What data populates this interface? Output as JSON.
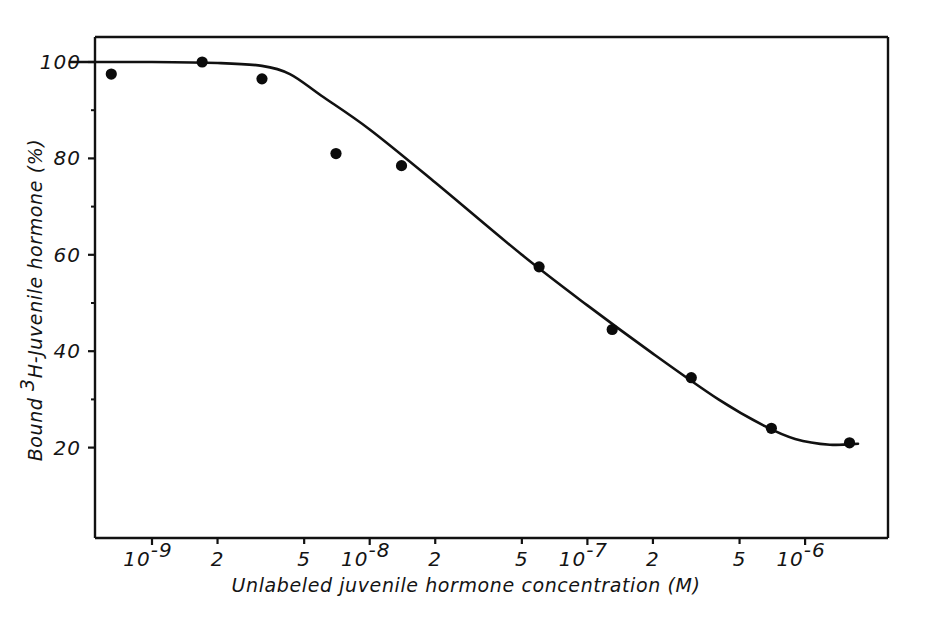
{
  "chart_data": {
    "type": "line",
    "title": "",
    "subtitle": "",
    "xlabel": "Unlabeled juvenile hormone concentration (M)",
    "ylabel": "Bound 3H-Juvenile hormone (%)",
    "ylabel_parts": {
      "prefix": "Bound ",
      "superscript": "3",
      "suffix": "H-Juvenile hormone (%)"
    },
    "xscale": "log",
    "yscale": "linear",
    "xlim": [
      4e-10,
      2.6e-06
    ],
    "ylim": [
      0,
      110
    ],
    "grid": false,
    "legend": null,
    "x_tick_labels": [
      {
        "value": 1e-09,
        "mantissa": "10",
        "exponent": "-9",
        "is_power": true
      },
      {
        "value": 2e-09,
        "mantissa": "2",
        "exponent": "",
        "is_power": false
      },
      {
        "value": 5e-09,
        "mantissa": "5",
        "exponent": "",
        "is_power": false
      },
      {
        "value": 1e-08,
        "mantissa": "10",
        "exponent": "-8",
        "is_power": true
      },
      {
        "value": 2e-08,
        "mantissa": "2",
        "exponent": "",
        "is_power": false
      },
      {
        "value": 5e-08,
        "mantissa": "5",
        "exponent": "",
        "is_power": false
      },
      {
        "value": 1e-07,
        "mantissa": "10",
        "exponent": "-7",
        "is_power": true
      },
      {
        "value": 2e-07,
        "mantissa": "2",
        "exponent": "",
        "is_power": false
      },
      {
        "value": 5e-07,
        "mantissa": "5",
        "exponent": "",
        "is_power": false
      },
      {
        "value": 1e-06,
        "mantissa": "10",
        "exponent": "-6",
        "is_power": true
      }
    ],
    "y_tick_labels": [
      {
        "value": 100,
        "label": "100"
      },
      {
        "value": 80,
        "label": "80"
      },
      {
        "value": 60,
        "label": "60"
      },
      {
        "value": 40,
        "label": "40"
      },
      {
        "value": 20,
        "label": "20"
      }
    ],
    "y_minor_ticks": [
      90,
      70,
      50,
      30
    ],
    "series": [
      {
        "name": "Bound 3H-Juvenile hormone displacement",
        "marker": "filled-circle",
        "marker_color": "#0b0b0b",
        "line_color": "#111111",
        "points": [
          {
            "x": 6.5e-10,
            "y": 97.5
          },
          {
            "x": 1.7e-09,
            "y": 100.0
          },
          {
            "x": 3.2e-09,
            "y": 96.5
          },
          {
            "x": 7e-09,
            "y": 81.0
          },
          {
            "x": 1.4e-08,
            "y": 78.5
          },
          {
            "x": 6e-08,
            "y": 57.5
          },
          {
            "x": 1.3e-07,
            "y": 44.5
          },
          {
            "x": 3e-07,
            "y": 34.5
          },
          {
            "x": 7e-07,
            "y": 24.0
          },
          {
            "x": 1.6e-06,
            "y": 21.0
          }
        ],
        "fitted_curve": [
          {
            "x": 4.2e-10,
            "y": 100.0
          },
          {
            "x": 1e-09,
            "y": 100.0
          },
          {
            "x": 2e-09,
            "y": 99.8
          },
          {
            "x": 3.2e-09,
            "y": 99.2
          },
          {
            "x": 4.3e-09,
            "y": 97.5
          },
          {
            "x": 6e-09,
            "y": 93.0
          },
          {
            "x": 1e-08,
            "y": 86.0
          },
          {
            "x": 2e-08,
            "y": 75.0
          },
          {
            "x": 5e-08,
            "y": 60.0
          },
          {
            "x": 1e-07,
            "y": 49.5
          },
          {
            "x": 2e-07,
            "y": 39.5
          },
          {
            "x": 4e-07,
            "y": 30.0
          },
          {
            "x": 6.5e-07,
            "y": 24.5
          },
          {
            "x": 9e-07,
            "y": 21.8
          },
          {
            "x": 1.3e-06,
            "y": 20.6
          },
          {
            "x": 1.75e-06,
            "y": 20.8
          }
        ]
      }
    ]
  },
  "figure": {
    "background_color": "#ffffff",
    "ink_color": "#111111",
    "frame": {
      "left": true,
      "top": true,
      "right": true,
      "bottom": true
    }
  }
}
